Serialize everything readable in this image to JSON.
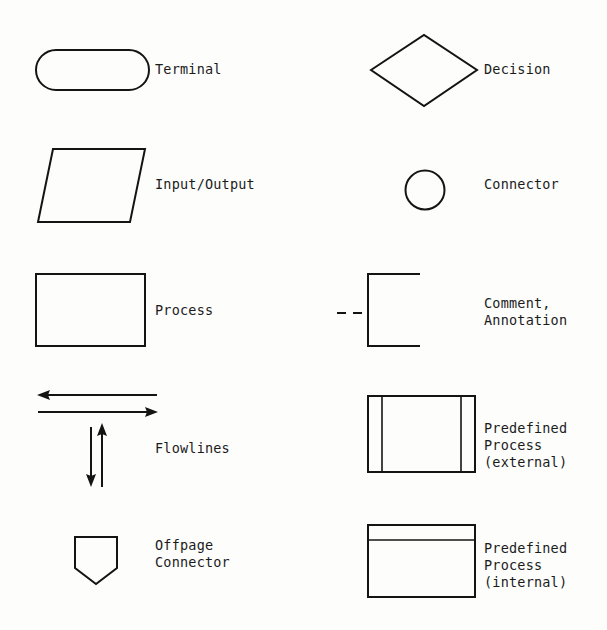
{
  "diagram": {
    "background_color": "#fdfdfb",
    "stroke_color": "#141414",
    "entries": [
      {
        "id": "terminal",
        "shape": "stadium",
        "label": "Terminal",
        "label_lines": [
          "Terminal"
        ],
        "column": "left",
        "row": 1
      },
      {
        "id": "input-output",
        "shape": "parallelogram",
        "label": "Input/Output",
        "label_lines": [
          "Input/Output"
        ],
        "column": "left",
        "row": 2
      },
      {
        "id": "process",
        "shape": "rectangle",
        "label": "Process",
        "label_lines": [
          "Process"
        ],
        "column": "left",
        "row": 3
      },
      {
        "id": "flowlines",
        "shape": "arrows",
        "label": "Flowlines",
        "label_lines": [
          "Flowlines"
        ],
        "column": "left",
        "row": 4
      },
      {
        "id": "offpage-connector",
        "shape": "pentagon-down",
        "label": "Offpage Connector",
        "label_lines": [
          "Offpage",
          "Connector"
        ],
        "column": "left",
        "row": 5
      },
      {
        "id": "decision",
        "shape": "diamond",
        "label": "Decision",
        "label_lines": [
          "Decision"
        ],
        "column": "right",
        "row": 1
      },
      {
        "id": "connector",
        "shape": "circle",
        "label": "Connector",
        "label_lines": [
          "Connector"
        ],
        "column": "right",
        "row": 2
      },
      {
        "id": "comment-annotation",
        "shape": "bracket-with-dashed-line",
        "label": "Comment, Annotation",
        "label_lines": [
          "Comment,",
          "Annotation"
        ],
        "column": "right",
        "row": 3
      },
      {
        "id": "predefined-process-external",
        "shape": "rectangle-double-vertical-bars",
        "label": "Predefined Process (external)",
        "label_lines": [
          "Predefined",
          "Process",
          "(external)"
        ],
        "column": "right",
        "row": 4
      },
      {
        "id": "predefined-process-internal",
        "shape": "rectangle-top-bar",
        "label": "Predefined Process (internal)",
        "label_lines": [
          "Predefined",
          "Process",
          "(internal)"
        ],
        "column": "right",
        "row": 5
      }
    ]
  }
}
